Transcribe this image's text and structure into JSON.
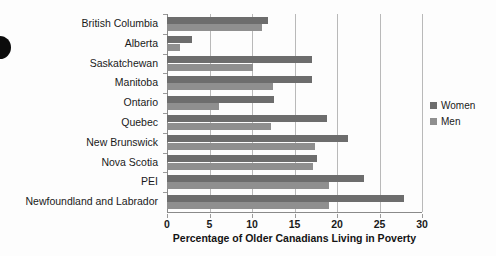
{
  "chart_data": {
    "type": "bar",
    "orientation": "horizontal",
    "title": "",
    "xlabel": "Percentage of Older Canadians Living in Poverty",
    "ylabel": "",
    "xlim": [
      0,
      30
    ],
    "xticks": [
      0,
      5,
      10,
      15,
      20,
      25,
      30
    ],
    "grid": true,
    "grid_axis": "x",
    "legend_position": "right",
    "categories": [
      "British Columbia",
      "Alberta",
      "Saskatchewan",
      "Manitoba",
      "Ontario",
      "Quebec",
      "New Brunswick",
      "Nova Scotia",
      "PEI",
      "Newfoundland and Labrador"
    ],
    "series": [
      {
        "name": "Women",
        "color": "#6d6d6d",
        "values": [
          11.9,
          2.9,
          17.1,
          17.1,
          12.6,
          18.8,
          21.3,
          17.6,
          23.2,
          27.9
        ]
      },
      {
        "name": "Men",
        "color": "#8f8f8f",
        "values": [
          11.2,
          1.5,
          10.1,
          12.5,
          6.1,
          12.2,
          17.4,
          17.2,
          19.0,
          19.0
        ]
      }
    ]
  },
  "axis": {
    "tick_labels": [
      "0",
      "5",
      "10",
      "15",
      "20",
      "25",
      "30"
    ]
  },
  "legend": {
    "items": [
      {
        "label": "Women",
        "color": "#6d6d6d"
      },
      {
        "label": "Men",
        "color": "#8f8f8f"
      }
    ]
  }
}
